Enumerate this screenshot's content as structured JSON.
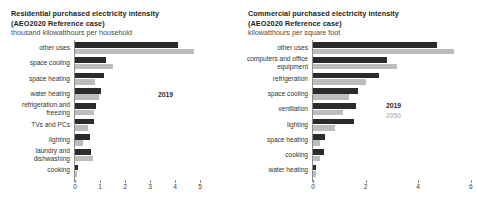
{
  "residential": {
    "title_line1": "Residential purchased electricity intensity",
    "title_line2": "(AEO2020 Reference case)",
    "subtitle": "thousand kilowatthours per household",
    "legend": {
      "series1": "2019",
      "series2": "2050"
    }
  },
  "commercial": {
    "title_line1": "Commercial purchased electricity intensity",
    "title_line2": "(AEO2020 Reference case)",
    "subtitle": "kilowatthours per square foot",
    "legend": {
      "series1": "2019",
      "series2": "2050"
    }
  },
  "chart_data": [
    {
      "type": "bar",
      "orientation": "horizontal",
      "title": "Residential purchased electricity intensity (AEO2020 Reference case)",
      "ylabel": "",
      "xlabel": "thousand kilowatthours per household",
      "xlim": [
        0,
        5
      ],
      "xticks": [
        "0",
        "1",
        "2",
        "3",
        "4",
        "5"
      ],
      "grid": false,
      "legend_position": "inside-right",
      "categories": [
        "other uses",
        "space cooling",
        "space heating",
        "water heating",
        "refrigeration and freezing",
        "TVs and PCs",
        "lighting",
        "laundry and dishwashing",
        "cooking"
      ],
      "series": [
        {
          "name": "2019",
          "color": "#2b2b2b",
          "values": [
            4.1,
            1.25,
            1.15,
            1.05,
            0.85,
            0.75,
            0.6,
            0.65,
            0.1
          ]
        },
        {
          "name": "2050",
          "color": "#bdbdbd",
          "values": [
            4.75,
            1.5,
            0.8,
            0.95,
            0.75,
            0.5,
            0.3,
            0.7,
            0.08
          ]
        }
      ]
    },
    {
      "type": "bar",
      "orientation": "horizontal",
      "title": "Commercial purchased electricity intensity (AEO2020 Reference case)",
      "ylabel": "",
      "xlabel": "kilowatthours per square foot",
      "xlim": [
        0,
        6
      ],
      "xticks": [
        "0",
        "2",
        "4",
        "6"
      ],
      "grid": false,
      "legend_position": "inside-right",
      "categories": [
        "other uses",
        "computers and office equipment",
        "refrigeration",
        "space cooling",
        "ventilation",
        "lighting",
        "space heating",
        "cooking",
        "water heating"
      ],
      "series": [
        {
          "name": "2019",
          "color": "#2b2b2b",
          "values": [
            4.7,
            2.8,
            2.5,
            1.7,
            1.65,
            1.55,
            0.45,
            0.4,
            0.12
          ]
        },
        {
          "name": "2050",
          "color": "#bdbdbd",
          "values": [
            5.35,
            3.2,
            2.0,
            1.35,
            1.15,
            0.85,
            0.25,
            0.25,
            0.1
          ]
        }
      ]
    }
  ]
}
